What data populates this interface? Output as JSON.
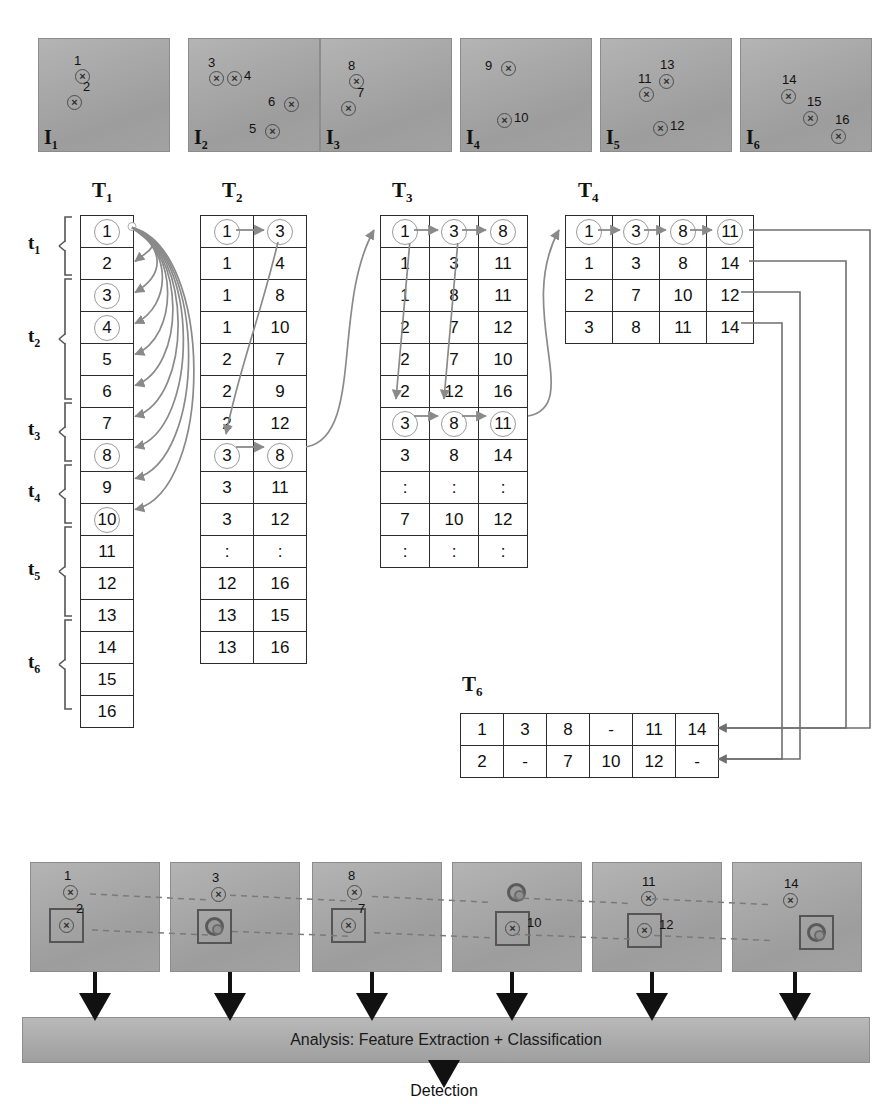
{
  "top_frames": [
    {
      "label": "I",
      "sub": "1",
      "markers": [
        {
          "num": "1",
          "x": 36,
          "y": 30,
          "numpos": "above-left"
        },
        {
          "num": "2",
          "x": 28,
          "y": 56,
          "numpos": "right-up"
        }
      ]
    },
    {
      "label": "I",
      "sub": "2",
      "markers": [
        {
          "num": "3",
          "x": 20,
          "y": 32,
          "numpos": "above-left"
        },
        {
          "num": "4",
          "x": 38,
          "y": 32,
          "numpos": "right"
        },
        {
          "num": "6",
          "x": 95,
          "y": 58,
          "numpos": "left"
        },
        {
          "num": "5",
          "x": 76,
          "y": 85,
          "numpos": "left"
        }
      ]
    },
    {
      "label": "I",
      "sub": "3",
      "markers": [
        {
          "num": "8",
          "x": 28,
          "y": 35,
          "numpos": "above-left"
        },
        {
          "num": "7",
          "x": 20,
          "y": 62,
          "numpos": "right-up"
        }
      ]
    },
    {
      "label": "I",
      "sub": "4",
      "markers": [
        {
          "num": "9",
          "x": 40,
          "y": 22,
          "numpos": "left"
        },
        {
          "num": "10",
          "x": 36,
          "y": 74,
          "numpos": "right"
        }
      ]
    },
    {
      "label": "I",
      "sub": "5",
      "markers": [
        {
          "num": "11",
          "x": 38,
          "y": 48,
          "numpos": "above-left"
        },
        {
          "num": "13",
          "x": 58,
          "y": 35,
          "numpos": "above"
        },
        {
          "num": "12",
          "x": 52,
          "y": 82,
          "numpos": "right"
        }
      ]
    },
    {
      "label": "I",
      "sub": "6",
      "markers": [
        {
          "num": "14",
          "x": 40,
          "y": 50,
          "numpos": "above"
        },
        {
          "num": "15",
          "x": 62,
          "y": 72,
          "numpos": "above-right"
        },
        {
          "num": "16",
          "x": 90,
          "y": 90,
          "numpos": "above-right"
        }
      ]
    }
  ],
  "tables": {
    "T1": {
      "label": "T",
      "sub": "1",
      "columns": 1,
      "rows": [
        {
          "cells": [
            "1"
          ],
          "circled": [
            true
          ]
        },
        {
          "cells": [
            "2"
          ],
          "circled": [
            false
          ]
        },
        {
          "cells": [
            "3"
          ],
          "circled": [
            true
          ]
        },
        {
          "cells": [
            "4"
          ],
          "circled": [
            true
          ]
        },
        {
          "cells": [
            "5"
          ],
          "circled": [
            false
          ]
        },
        {
          "cells": [
            "6"
          ],
          "circled": [
            false
          ]
        },
        {
          "cells": [
            "7"
          ],
          "circled": [
            false
          ]
        },
        {
          "cells": [
            "8"
          ],
          "circled": [
            true
          ]
        },
        {
          "cells": [
            "9"
          ],
          "circled": [
            false
          ]
        },
        {
          "cells": [
            "10"
          ],
          "circled": [
            true
          ]
        },
        {
          "cells": [
            "11"
          ],
          "circled": [
            false
          ]
        },
        {
          "cells": [
            "12"
          ],
          "circled": [
            false
          ]
        },
        {
          "cells": [
            "13"
          ],
          "circled": [
            false
          ]
        },
        {
          "cells": [
            "14"
          ],
          "circled": [
            false
          ]
        },
        {
          "cells": [
            "15"
          ],
          "circled": [
            false
          ]
        },
        {
          "cells": [
            "16"
          ],
          "circled": [
            false
          ]
        }
      ]
    },
    "T2": {
      "label": "T",
      "sub": "2",
      "columns": 2,
      "rows": [
        {
          "cells": [
            "1",
            "3"
          ],
          "circled": [
            true,
            true
          ]
        },
        {
          "cells": [
            "1",
            "4"
          ],
          "circled": [
            false,
            false
          ]
        },
        {
          "cells": [
            "1",
            "8"
          ],
          "circled": [
            false,
            false
          ]
        },
        {
          "cells": [
            "1",
            "10"
          ],
          "circled": [
            false,
            false
          ]
        },
        {
          "cells": [
            "2",
            "7"
          ],
          "circled": [
            false,
            false
          ]
        },
        {
          "cells": [
            "2",
            "9"
          ],
          "circled": [
            false,
            false
          ]
        },
        {
          "cells": [
            "2",
            "12"
          ],
          "circled": [
            false,
            false
          ]
        },
        {
          "cells": [
            "3",
            "8"
          ],
          "circled": [
            true,
            true
          ]
        },
        {
          "cells": [
            "3",
            "11"
          ],
          "circled": [
            false,
            false
          ]
        },
        {
          "cells": [
            "3",
            "12"
          ],
          "circled": [
            false,
            false
          ]
        },
        {
          "cells": [
            ":",
            ":"
          ],
          "circled": [
            false,
            false
          ]
        },
        {
          "cells": [
            "12",
            "16"
          ],
          "circled": [
            false,
            false
          ]
        },
        {
          "cells": [
            "13",
            "15"
          ],
          "circled": [
            false,
            false
          ]
        },
        {
          "cells": [
            "13",
            "16"
          ],
          "circled": [
            false,
            false
          ]
        }
      ]
    },
    "T3": {
      "label": "T",
      "sub": "3",
      "columns": 3,
      "rows": [
        {
          "cells": [
            "1",
            "3",
            "8"
          ],
          "circled": [
            true,
            true,
            true
          ]
        },
        {
          "cells": [
            "1",
            "3",
            "11"
          ],
          "circled": [
            false,
            false,
            false
          ]
        },
        {
          "cells": [
            "1",
            "8",
            "11"
          ],
          "circled": [
            false,
            false,
            false
          ]
        },
        {
          "cells": [
            "2",
            "7",
            "12"
          ],
          "circled": [
            false,
            false,
            false
          ]
        },
        {
          "cells": [
            "2",
            "7",
            "10"
          ],
          "circled": [
            false,
            false,
            false
          ]
        },
        {
          "cells": [
            "2",
            "12",
            "16"
          ],
          "circled": [
            false,
            false,
            false
          ]
        },
        {
          "cells": [
            "3",
            "8",
            "11"
          ],
          "circled": [
            true,
            true,
            true
          ]
        },
        {
          "cells": [
            "3",
            "8",
            "14"
          ],
          "circled": [
            false,
            false,
            false
          ]
        },
        {
          "cells": [
            ":",
            ":",
            ":"
          ],
          "circled": [
            false,
            false,
            false
          ]
        },
        {
          "cells": [
            "7",
            "10",
            "12"
          ],
          "circled": [
            false,
            false,
            false
          ]
        },
        {
          "cells": [
            ":",
            ":",
            ":"
          ],
          "circled": [
            false,
            false,
            false
          ]
        }
      ]
    },
    "T4": {
      "label": "T",
      "sub": "4",
      "columns": 4,
      "rows": [
        {
          "cells": [
            "1",
            "3",
            "8",
            "11"
          ],
          "circled": [
            true,
            true,
            true,
            true
          ]
        },
        {
          "cells": [
            "1",
            "3",
            "8",
            "14"
          ],
          "circled": [
            false,
            false,
            false,
            false
          ]
        },
        {
          "cells": [
            "2",
            "7",
            "10",
            "12"
          ],
          "circled": [
            false,
            false,
            false,
            false
          ]
        },
        {
          "cells": [
            "3",
            "8",
            "11",
            "14"
          ],
          "circled": [
            false,
            false,
            false,
            false
          ]
        }
      ]
    },
    "T6": {
      "label": "T",
      "sub": "6",
      "columns": 6,
      "rows": [
        {
          "cells": [
            "1",
            "3",
            "8",
            "-",
            "11",
            "14"
          ],
          "circled": [
            false,
            false,
            false,
            false,
            false,
            false
          ]
        },
        {
          "cells": [
            "2",
            "-",
            "7",
            "10",
            "12",
            "-"
          ],
          "circled": [
            false,
            false,
            false,
            false,
            false,
            false
          ]
        }
      ]
    }
  },
  "time_labels": [
    {
      "label": "t",
      "sub": "1",
      "span": 2
    },
    {
      "label": "t",
      "sub": "2",
      "span": 4
    },
    {
      "label": "t",
      "sub": "3",
      "span": 2
    },
    {
      "label": "t",
      "sub": "4",
      "span": 2
    },
    {
      "label": "t",
      "sub": "5",
      "span": 3
    },
    {
      "label": "t",
      "sub": "6",
      "span": 3
    }
  ],
  "bottom_frames": [
    {
      "markers": [
        {
          "num": "1",
          "x": 32,
          "y": 22,
          "type": "x",
          "numpos": "above"
        },
        {
          "num": "2",
          "x": 28,
          "y": 55,
          "type": "x",
          "boxed": true,
          "numpos": "right-up"
        }
      ]
    },
    {
      "markers": [
        {
          "num": "3",
          "x": 40,
          "y": 24,
          "type": "x",
          "numpos": "above"
        },
        {
          "num": "",
          "x": 36,
          "y": 56,
          "type": "bullseye",
          "boxed": true,
          "numpos": "none"
        }
      ]
    },
    {
      "markers": [
        {
          "num": "8",
          "x": 34,
          "y": 22,
          "type": "x",
          "numpos": "above"
        },
        {
          "num": "7",
          "x": 28,
          "y": 55,
          "type": "x",
          "boxed": true,
          "numpos": "right-up"
        }
      ]
    },
    {
      "markers": [
        {
          "num": "",
          "x": 56,
          "y": 22,
          "type": "bullseye",
          "numpos": "none"
        },
        {
          "num": "10",
          "x": 52,
          "y": 58,
          "type": "x",
          "boxed": true,
          "numpos": "right"
        }
      ]
    },
    {
      "markers": [
        {
          "num": "11",
          "x": 48,
          "y": 28,
          "type": "x",
          "numpos": "above"
        },
        {
          "num": "12",
          "x": 44,
          "y": 60,
          "type": "x",
          "boxed": true,
          "numpos": "right"
        }
      ]
    },
    {
      "markers": [
        {
          "num": "14",
          "x": 50,
          "y": 30,
          "type": "x",
          "numpos": "above"
        },
        {
          "num": "",
          "x": 76,
          "y": 62,
          "type": "bullseye",
          "boxed": true,
          "numpos": "none"
        }
      ]
    }
  ],
  "analysis": {
    "bar_text": "Analysis: Feature Extraction + Classification",
    "output_text": "Detection"
  },
  "colors": {
    "arrow_gray": "#8a8a8a",
    "arrow_dark": "#6f6f6f",
    "frame_fill": "#a8a8a8",
    "table_border": "#2b2b2b",
    "circle_stroke": "#9b9b9b",
    "dashed_link": "#7a7a7a"
  }
}
